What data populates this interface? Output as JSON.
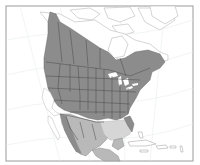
{
  "map": {
    "subject": "North America species range map",
    "frame": {
      "x": 6,
      "y": 6,
      "width": 187,
      "height": 155
    },
    "colors": {
      "background": "#ffffff",
      "frame": "#9a9a9a",
      "graticule": "#e8ecef",
      "land_outline": "#b8b8b8",
      "range_primary": "#8c8c8c",
      "range_secondary": "#b9b9b9",
      "range_tertiary": "#d6d6d6",
      "borders": "#4a4a4a",
      "water": "#ffffff"
    },
    "legend": [],
    "labels": []
  }
}
